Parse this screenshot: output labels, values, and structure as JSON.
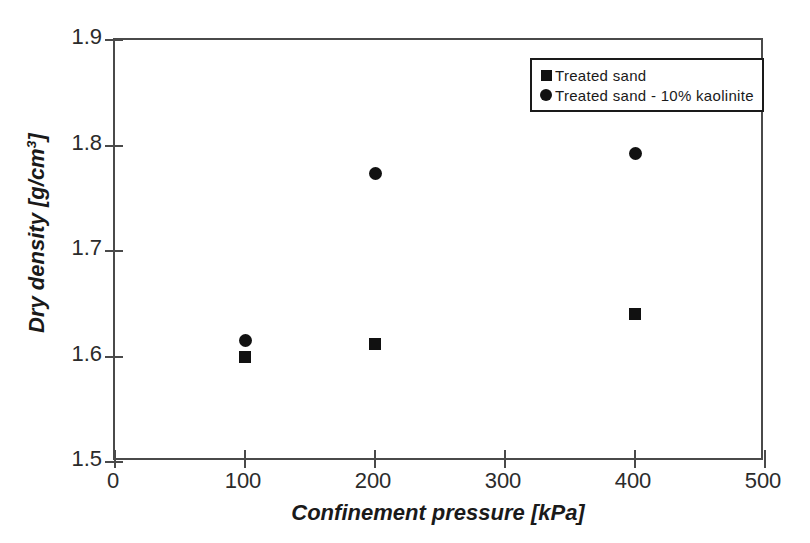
{
  "chart_data": {
    "type": "scatter",
    "title": "",
    "xlabel": "Confinement pressure [kPa]",
    "ylabel": "Dry density [g/cm3]",
    "ylabel_base": "Dry density [g/cm",
    "ylabel_sup": "3",
    "ylabel_tail": "]",
    "xlim": [
      0,
      500
    ],
    "ylim": [
      1.5,
      1.9
    ],
    "xticks": [
      0,
      100,
      200,
      300,
      400,
      500
    ],
    "yticks": [
      1.5,
      1.6,
      1.7,
      1.8,
      1.9
    ],
    "xtick_labels": [
      "0",
      "100",
      "200",
      "300",
      "400",
      "500"
    ],
    "ytick_labels": [
      "1.5",
      "1.6",
      "1.7",
      "1.8",
      "1.9"
    ],
    "grid": false,
    "legend_position": "top-right",
    "marker_color": "#111111",
    "frame_color": "#4a4a4a",
    "series": [
      {
        "name": "Treated sand",
        "marker": "square",
        "x": [
          100,
          200,
          400
        ],
        "y": [
          1.6,
          1.612,
          1.64
        ]
      },
      {
        "name": "Treated sand - 10% kaolinite",
        "marker": "circle",
        "x": [
          100,
          200,
          400
        ],
        "y": [
          1.615,
          1.773,
          1.792
        ]
      }
    ]
  },
  "legend": {
    "items": [
      {
        "label": "Treated sand",
        "marker": "square"
      },
      {
        "label": "Treated sand - 10% kaolinite",
        "marker": "circle"
      }
    ]
  }
}
